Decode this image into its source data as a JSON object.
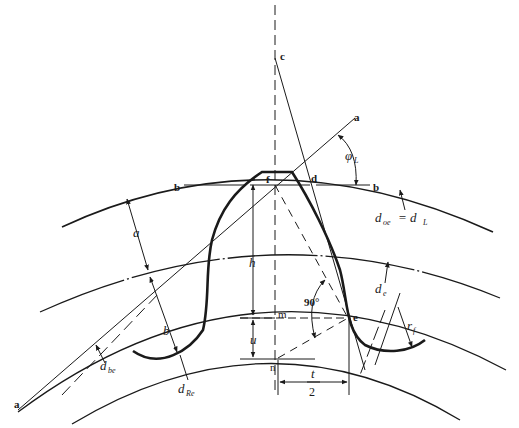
{
  "diagram": {
    "stroke_color": "#1a1a1a",
    "background": "#ffffff",
    "points": {
      "a_top": "a",
      "a_bottom": "a",
      "b_left": "b",
      "b_right": "b",
      "c": "c",
      "d": "d",
      "e": "e",
      "f": "f",
      "m": "m",
      "n": "n"
    },
    "dimensions": {
      "addendum": "a",
      "dedendum": "b",
      "height": "h",
      "u": "u",
      "half_thickness_num": "t",
      "half_thickness_den": "2",
      "fillet_radius": "r",
      "fillet_radius_sub": "f",
      "angle_90": "90°",
      "load_angle": "φ",
      "load_angle_sub": "L"
    },
    "circles": {
      "outside": {
        "base": "d",
        "sub": "oe",
        "eq": "= d",
        "eq_sub": "L"
      },
      "pitch": {
        "base": "d",
        "sub": "e"
      },
      "base": {
        "base": "d",
        "sub": "be"
      },
      "root": {
        "base": "d",
        "sub": "Re"
      }
    }
  }
}
